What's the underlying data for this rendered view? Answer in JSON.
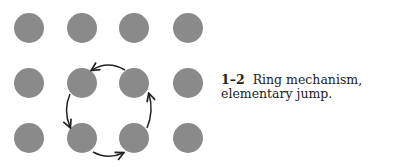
{
  "figure": {
    "grid": {
      "columns_x": [
        29,
        82,
        134,
        188
      ],
      "rows_y": [
        28,
        83,
        138
      ],
      "radius": 15,
      "atom_color": "#8a8a8a"
    },
    "ring": {
      "atoms": [
        [
          1,
          1
        ],
        [
          2,
          1
        ],
        [
          2,
          2
        ],
        [
          1,
          2
        ]
      ],
      "arrow_color": "#222222",
      "direction": "counterclockwise"
    },
    "caption": {
      "number": "1–2",
      "text": "Ring mechanism, elementary jump."
    }
  }
}
